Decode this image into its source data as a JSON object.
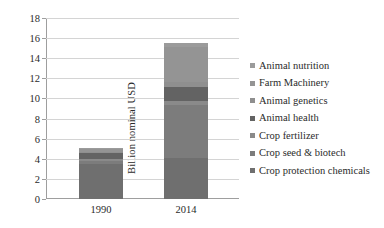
{
  "chart_data": {
    "type": "bar",
    "stacked": true,
    "title": "",
    "xlabel": "",
    "ylabel": "Billion nominal USD",
    "categories": [
      "1990",
      "2014"
    ],
    "ylim": [
      0,
      18
    ],
    "ytick_step": 2,
    "yticks": [
      "18",
      "16",
      "14",
      "12",
      "10",
      "8",
      "6",
      "4",
      "2",
      "0"
    ],
    "grid": "horizontal",
    "legend_position": "right",
    "series": [
      {
        "name": "Crop protection chemicals",
        "color": "#6f6f6f",
        "values": [
          3.5,
          4.1
        ]
      },
      {
        "name": "Crop seed & biotech",
        "color": "#7c7c7c",
        "values": [
          0.3,
          5.3
        ]
      },
      {
        "name": "Crop fertilizer",
        "color": "#8a8a8a",
        "values": [
          0.2,
          0.3
        ]
      },
      {
        "name": "Animal health",
        "color": "#636363",
        "values": [
          0.6,
          1.4
        ]
      },
      {
        "name": "Animal genetics",
        "color": "#8f8f8f",
        "values": [
          0.1,
          0.5
        ]
      },
      {
        "name": "Farm Machinery",
        "color": "#949494",
        "values": [
          0.3,
          3.5
        ]
      },
      {
        "name": "Animal nutrition",
        "color": "#9b9b9b",
        "values": [
          0.1,
          0.4
        ]
      }
    ],
    "totals": [
      5.1,
      15.5
    ]
  },
  "legend": {
    "items": [
      {
        "label": "Animal nutrition",
        "color": "#9b9b9b"
      },
      {
        "label": "Farm Machinery",
        "color": "#949494"
      },
      {
        "label": "Animal genetics",
        "color": "#8f8f8f"
      },
      {
        "label": "Animal health",
        "color": "#636363"
      },
      {
        "label": "Crop fertilizer",
        "color": "#8a8a8a"
      },
      {
        "label": "Crop seed & biotech",
        "color": "#7c7c7c"
      },
      {
        "label": "Crop protection chemicals",
        "color": "#6f6f6f"
      }
    ]
  }
}
